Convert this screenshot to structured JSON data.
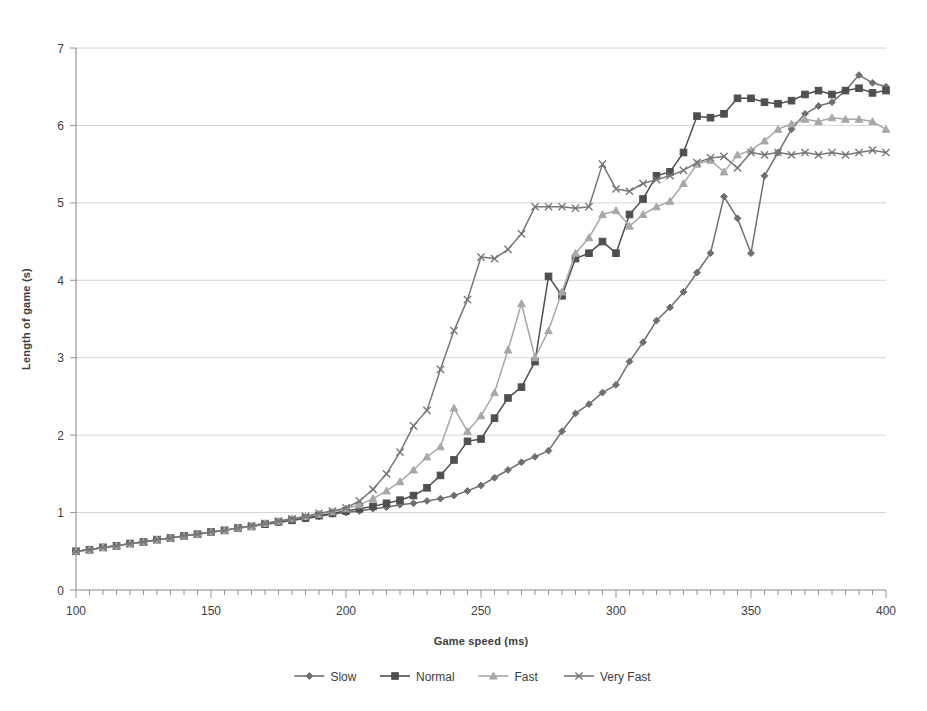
{
  "chart_data": {
    "type": "line",
    "title": "",
    "xlabel": "Game speed (ms)",
    "ylabel": "Length of game (s)",
    "xlim": [
      100,
      400
    ],
    "ylim": [
      0,
      7
    ],
    "xticks": [
      100,
      150,
      200,
      250,
      300,
      350,
      400
    ],
    "yticks": [
      0,
      1,
      2,
      3,
      4,
      5,
      6,
      7
    ],
    "xtick_labels": [
      "100",
      "150",
      "200",
      "250",
      "300",
      "350",
      "400"
    ],
    "ytick_labels": [
      "0",
      "1",
      "2",
      "3",
      "4",
      "5",
      "6",
      "7"
    ],
    "x_minor_tick_step": 5,
    "grid": "horizontal",
    "legend_position": "bottom",
    "x": [
      100,
      105,
      110,
      115,
      120,
      125,
      130,
      135,
      140,
      145,
      150,
      155,
      160,
      165,
      170,
      175,
      180,
      185,
      190,
      195,
      200,
      205,
      210,
      215,
      220,
      225,
      230,
      235,
      240,
      245,
      250,
      255,
      260,
      265,
      270,
      275,
      280,
      285,
      290,
      295,
      300,
      305,
      310,
      315,
      320,
      325,
      330,
      335,
      340,
      345,
      350,
      355,
      360,
      365,
      370,
      375,
      380,
      385,
      390,
      395,
      400
    ],
    "series": [
      {
        "name": "Slow",
        "marker": "diamond",
        "color": "#6f6f6f",
        "values": [
          0.5,
          0.52,
          0.55,
          0.57,
          0.6,
          0.62,
          0.65,
          0.67,
          0.7,
          0.72,
          0.75,
          0.77,
          0.8,
          0.82,
          0.85,
          0.87,
          0.9,
          0.92,
          0.95,
          0.98,
          1.0,
          1.02,
          1.05,
          1.07,
          1.1,
          1.12,
          1.15,
          1.18,
          1.22,
          1.28,
          1.35,
          1.45,
          1.55,
          1.65,
          1.72,
          1.8,
          2.05,
          2.28,
          2.4,
          2.55,
          2.65,
          2.95,
          3.2,
          3.48,
          3.65,
          3.85,
          4.1,
          4.35,
          5.08,
          4.8,
          4.35,
          5.35,
          5.65,
          5.95,
          6.15,
          6.25,
          6.3,
          6.45,
          6.65,
          6.55,
          6.5
        ]
      },
      {
        "name": "Normal",
        "marker": "square",
        "color": "#4f4f4f",
        "values": [
          0.5,
          0.52,
          0.55,
          0.57,
          0.6,
          0.62,
          0.65,
          0.67,
          0.7,
          0.72,
          0.75,
          0.77,
          0.8,
          0.82,
          0.85,
          0.88,
          0.9,
          0.93,
          0.96,
          0.99,
          1.02,
          1.05,
          1.08,
          1.12,
          1.16,
          1.22,
          1.32,
          1.48,
          1.68,
          1.92,
          1.95,
          2.22,
          2.48,
          2.62,
          2.95,
          4.05,
          3.8,
          4.28,
          4.35,
          4.5,
          4.35,
          4.85,
          5.05,
          5.35,
          5.4,
          5.65,
          6.12,
          6.1,
          6.15,
          6.35,
          6.35,
          6.3,
          6.28,
          6.32,
          6.4,
          6.45,
          6.4,
          6.45,
          6.48,
          6.42,
          6.45
        ]
      },
      {
        "name": "Fast",
        "marker": "triangle",
        "color": "#a8a8a8",
        "values": [
          0.5,
          0.52,
          0.55,
          0.57,
          0.6,
          0.62,
          0.65,
          0.67,
          0.7,
          0.72,
          0.75,
          0.77,
          0.8,
          0.82,
          0.86,
          0.89,
          0.92,
          0.95,
          0.98,
          1.01,
          1.05,
          1.1,
          1.18,
          1.28,
          1.4,
          1.55,
          1.72,
          1.85,
          2.35,
          2.05,
          2.25,
          2.55,
          3.1,
          3.7,
          3.0,
          3.35,
          3.85,
          4.35,
          4.55,
          4.85,
          4.9,
          4.7,
          4.85,
          4.95,
          5.02,
          5.25,
          5.5,
          5.55,
          5.4,
          5.62,
          5.68,
          5.8,
          5.95,
          6.02,
          6.08,
          6.05,
          6.1,
          6.08,
          6.08,
          6.05,
          5.95
        ]
      },
      {
        "name": "Very Fast",
        "marker": "x",
        "color": "#777777",
        "values": [
          0.5,
          0.52,
          0.55,
          0.57,
          0.6,
          0.62,
          0.65,
          0.67,
          0.7,
          0.72,
          0.75,
          0.77,
          0.8,
          0.83,
          0.86,
          0.89,
          0.92,
          0.95,
          0.99,
          1.02,
          1.06,
          1.15,
          1.3,
          1.5,
          1.78,
          2.12,
          2.32,
          2.85,
          3.35,
          3.75,
          4.3,
          4.28,
          4.4,
          4.6,
          4.95,
          4.95,
          4.95,
          4.93,
          4.95,
          5.5,
          5.18,
          5.15,
          5.25,
          5.3,
          5.35,
          5.42,
          5.52,
          5.58,
          5.6,
          5.45,
          5.65,
          5.62,
          5.65,
          5.62,
          5.65,
          5.62,
          5.65,
          5.62,
          5.65,
          5.68,
          5.65
        ]
      }
    ]
  }
}
